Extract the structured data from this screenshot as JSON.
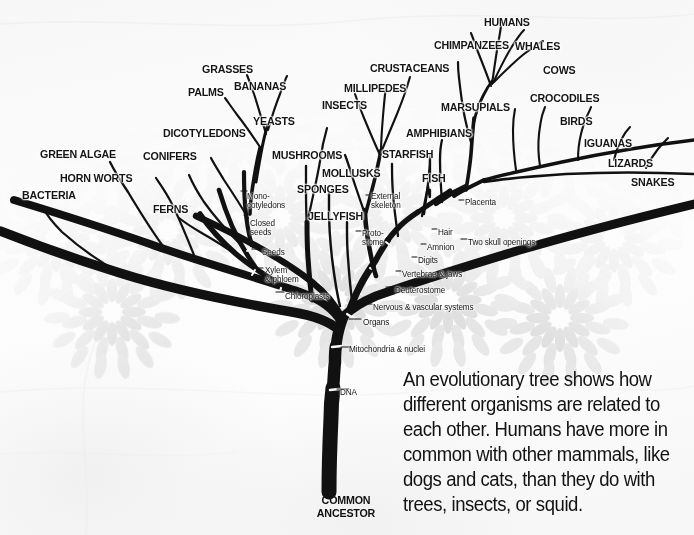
{
  "figure": {
    "title": "Evolutionary Tree",
    "root_label_line1": "COMMON",
    "root_label_line2": "ANCESTOR",
    "caption": "An evolutionary tree shows how different organisms are related to each other. Humans have more in common with other mammals, like dogs and cats, than they do with trees, insects, or squid."
  },
  "colors": {
    "branch": "#111111",
    "background": "#fbfbfb",
    "floral": "#d9d9d9",
    "text": "#151515"
  },
  "tips": [
    {
      "label": "BACTERIA",
      "x": 22,
      "y": 190,
      "align": "left"
    },
    {
      "label": "GREEN ALGAE",
      "x": 40,
      "y": 149,
      "align": "left"
    },
    {
      "label": "HORN WORTS",
      "x": 60,
      "y": 173,
      "align": "left"
    },
    {
      "label": "FERNS",
      "x": 153,
      "y": 204,
      "align": "left"
    },
    {
      "label": "CONIFERS",
      "x": 143,
      "y": 151,
      "align": "left"
    },
    {
      "label": "DICOTYLEDONS",
      "x": 163,
      "y": 128,
      "align": "left"
    },
    {
      "label": "PALMS",
      "x": 188,
      "y": 87,
      "align": "left"
    },
    {
      "label": "GRASSES",
      "x": 202,
      "y": 64,
      "align": "left"
    },
    {
      "label": "BANANAS",
      "x": 234,
      "y": 81,
      "align": "left"
    },
    {
      "label": "YEASTS",
      "x": 253,
      "y": 116,
      "align": "left"
    },
    {
      "label": "MUSHROOMS",
      "x": 272,
      "y": 150,
      "align": "left"
    },
    {
      "label": "SPONGES",
      "x": 297,
      "y": 184,
      "align": "left"
    },
    {
      "label": "JELLYFISH",
      "x": 308,
      "y": 211,
      "align": "left"
    },
    {
      "label": "MOLLUSKS",
      "x": 322,
      "y": 168,
      "align": "left"
    },
    {
      "label": "INSECTS",
      "x": 322,
      "y": 100,
      "align": "left"
    },
    {
      "label": "MILLIPEDES",
      "x": 344,
      "y": 83,
      "align": "left"
    },
    {
      "label": "CRUSTACEANS",
      "x": 370,
      "y": 63,
      "align": "left"
    },
    {
      "label": "STARFISH",
      "x": 382,
      "y": 149,
      "align": "left"
    },
    {
      "label": "FISH",
      "x": 422,
      "y": 173,
      "align": "left"
    },
    {
      "label": "AMPHIBIANS",
      "x": 406,
      "y": 128,
      "align": "left"
    },
    {
      "label": "MARSUPIALS",
      "x": 441,
      "y": 102,
      "align": "left"
    },
    {
      "label": "CHIMPANZEES",
      "x": 434,
      "y": 40,
      "align": "left"
    },
    {
      "label": "HUMANS",
      "x": 484,
      "y": 17,
      "align": "left"
    },
    {
      "label": "WHALES",
      "x": 515,
      "y": 41,
      "align": "left"
    },
    {
      "label": "COWS",
      "x": 543,
      "y": 65,
      "align": "left"
    },
    {
      "label": "CROCODILES",
      "x": 530,
      "y": 93,
      "align": "left"
    },
    {
      "label": "BIRDS",
      "x": 560,
      "y": 116,
      "align": "left"
    },
    {
      "label": "IGUANAS",
      "x": 584,
      "y": 138,
      "align": "left"
    },
    {
      "label": "LIZARDS",
      "x": 608,
      "y": 158,
      "align": "left"
    },
    {
      "label": "SNAKES",
      "x": 631,
      "y": 177,
      "align": "left"
    }
  ],
  "traits": [
    {
      "label": "DNA",
      "x": 340,
      "y": 388,
      "lines": 1
    },
    {
      "label": "Mitochondria & nuclei",
      "x": 349,
      "y": 345,
      "lines": 1
    },
    {
      "label": "Organs",
      "x": 363,
      "y": 318,
      "lines": 1
    },
    {
      "label": "Chloroplasts",
      "x": 285,
      "y": 292,
      "lines": 1
    },
    {
      "label": "Xylem\n& phloem",
      "x": 265,
      "y": 266,
      "lines": 2
    },
    {
      "label": "Seeds",
      "x": 262,
      "y": 248,
      "lines": 1
    },
    {
      "label": "Closed\nseeds",
      "x": 250,
      "y": 219,
      "lines": 2
    },
    {
      "label": "Mono-\ncotyledons",
      "x": 247,
      "y": 192,
      "lines": 2
    },
    {
      "label": "Nervous & vascular systems",
      "x": 373,
      "y": 303,
      "lines": 1
    },
    {
      "label": "Deuterostome",
      "x": 395,
      "y": 286,
      "lines": 1
    },
    {
      "label": "Vertebrae & jaws",
      "x": 402,
      "y": 270,
      "lines": 1
    },
    {
      "label": "Digits",
      "x": 418,
      "y": 256,
      "lines": 1
    },
    {
      "label": "Amnion",
      "x": 427,
      "y": 243,
      "lines": 1
    },
    {
      "label": "Hair",
      "x": 438,
      "y": 228,
      "lines": 1
    },
    {
      "label": "Placenta",
      "x": 465,
      "y": 198,
      "lines": 1
    },
    {
      "label": "Two skull openings",
      "x": 468,
      "y": 238,
      "lines": 1
    },
    {
      "label": "Proto-\nstome",
      "x": 362,
      "y": 229,
      "lines": 2
    },
    {
      "label": "External\nskeleton",
      "x": 371,
      "y": 192,
      "lines": 2
    }
  ]
}
